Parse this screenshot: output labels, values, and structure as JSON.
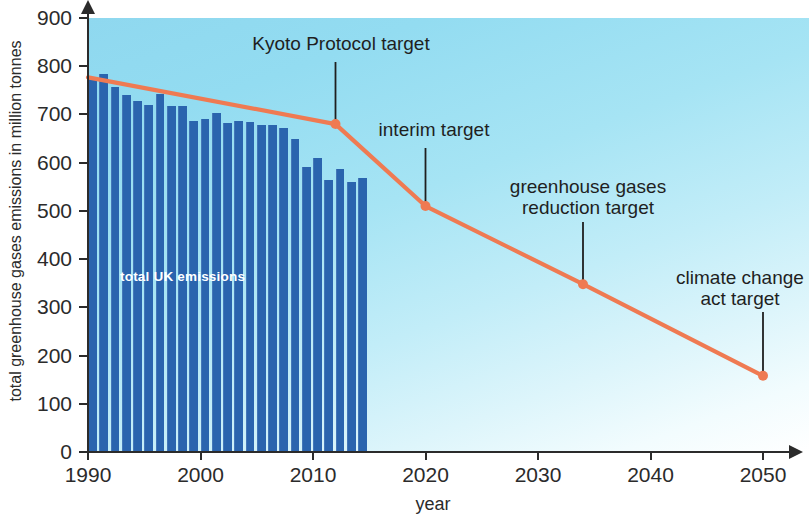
{
  "chart_data": {
    "type": "bar",
    "title": "",
    "xlabel": "year",
    "ylabel": "total greenhouse gases emissions in million tonnes",
    "xlim": [
      1990,
      2052
    ],
    "ylim": [
      0,
      900
    ],
    "ytick_values": [
      0,
      100,
      200,
      300,
      400,
      500,
      600,
      700,
      800,
      900
    ],
    "ytick_labels": [
      "0",
      "100",
      "200",
      "300",
      "400",
      "500",
      "600",
      "700",
      "800",
      "900"
    ],
    "xtick_values": [
      1990,
      2000,
      2010,
      2020,
      2030,
      2040,
      2050
    ],
    "xtick_labels": [
      "1990",
      "2000",
      "2010",
      "2020",
      "2030",
      "2040",
      "2050"
    ],
    "grid": false,
    "legend": "none",
    "series": [
      {
        "name": "total UK emissions",
        "type": "bar",
        "color": "#2a64ae",
        "inline_label": "total UK emissions",
        "x": [
          1990,
          1991,
          1992,
          1993,
          1994,
          1995,
          1996,
          1997,
          1998,
          1999,
          2000,
          2001,
          2002,
          2003,
          2004,
          2005,
          2006,
          2007,
          2008,
          2009,
          2010,
          2011,
          2012,
          2013,
          2014
        ],
        "values": [
          776,
          783,
          757,
          740,
          728,
          720,
          742,
          718,
          717,
          686,
          690,
          703,
          682,
          687,
          684,
          679,
          679,
          671,
          650,
          591,
          610,
          565,
          586,
          560,
          568
        ]
      },
      {
        "name": "emissions reduction pathway and targets",
        "type": "line",
        "color": "#ef7a52",
        "x": [
          1990,
          2012,
          2020,
          2034,
          2050
        ],
        "values": [
          777,
          680,
          510,
          348,
          158
        ],
        "markers_at": [
          2012,
          2020,
          2034,
          2050
        ]
      }
    ],
    "annotations": [
      {
        "text": "Kyoto Protocol target",
        "target_x": 2012,
        "target_y": 680
      },
      {
        "text": "interim target",
        "target_x": 2020,
        "target_y": 510
      },
      {
        "text": "greenhouse gases\nreduction target",
        "target_x": 2034,
        "target_y": 348
      },
      {
        "text": "climate change\nact target",
        "target_x": 2050,
        "target_y": 158
      }
    ],
    "colors": {
      "bar": "#2a64ae",
      "target_line": "#ef7a52",
      "axis": "#2b2b2b",
      "background_top": "#8fd8ef",
      "background_bottom": "#ffffff",
      "inline_label_text": "#ffffff"
    }
  }
}
